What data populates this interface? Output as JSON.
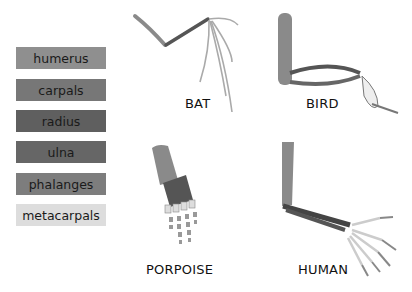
{
  "legend": {
    "items": [
      {
        "label": "humerus",
        "color": "#8f8f8f"
      },
      {
        "label": "carpals",
        "color": "#777777"
      },
      {
        "label": "radius",
        "color": "#5f5f5f"
      },
      {
        "label": "ulna",
        "color": "#666666"
      },
      {
        "label": "phalanges",
        "color": "#7d7d7d"
      },
      {
        "label": "metacarpals",
        "color": "#dddddd"
      }
    ]
  },
  "animals": {
    "bat": "BAT",
    "bird": "BIRD",
    "porpoise": "PORPOISE",
    "human": "HUMAN"
  }
}
